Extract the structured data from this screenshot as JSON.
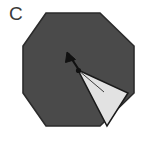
{
  "figure": {
    "panel_label": "C",
    "shapes": {
      "octagon": {
        "name": "octagon",
        "fill": "#4a4a4a",
        "stroke": "#2b2b2b",
        "points": "46,13 100,13 134,46 134,93 100,126 46,126 23,93 23,46"
      },
      "wedge": {
        "name": "light-triangle-wedge",
        "fill": "#e2e2e2",
        "stroke": "#1a1a1a",
        "points": "78,70 128,93 107,126"
      },
      "wedge_inner_line": {
        "name": "wedge-inner-line",
        "stroke": "#3c3c3c",
        "x1": 78,
        "y1": 70,
        "x2": 104,
        "y2": 92
      },
      "arrow": {
        "name": "arrow",
        "stroke": "#111111",
        "fill": "#111111",
        "tail_x": 79,
        "tail_y": 70,
        "tip_x": 67,
        "tip_y": 52,
        "head_points": "67,52 65.5,62.5 75.5,59.5"
      },
      "apex_dot": {
        "name": "apex-vertex-dot",
        "fill": "#111111",
        "cx": 78.5,
        "cy": 70.5,
        "r": 2.6
      }
    }
  }
}
